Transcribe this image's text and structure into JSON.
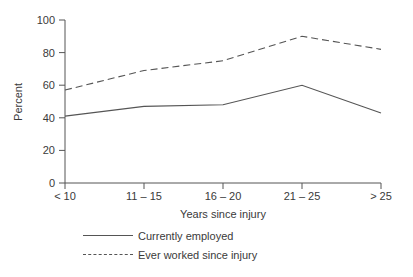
{
  "chart_data": {
    "type": "line",
    "title": "",
    "xlabel": "Years since injury",
    "ylabel": "Percent",
    "categories": [
      "< 10",
      "11 – 15",
      "16 – 20",
      "21 – 25",
      "> 25"
    ],
    "ylim": [
      0,
      100
    ],
    "yticks": [
      0,
      20,
      40,
      60,
      80,
      100
    ],
    "grid": false,
    "legend_position": "bottom-left",
    "series": [
      {
        "name": "Currently employed",
        "style": "solid",
        "values": [
          41,
          47,
          48,
          60,
          43
        ]
      },
      {
        "name": "Ever worked since injury",
        "style": "dashed",
        "values": [
          57,
          69,
          75,
          90,
          82
        ]
      }
    ]
  },
  "colors": {
    "line": "#555555",
    "axis": "#555555",
    "text": "#3a3a3a"
  }
}
